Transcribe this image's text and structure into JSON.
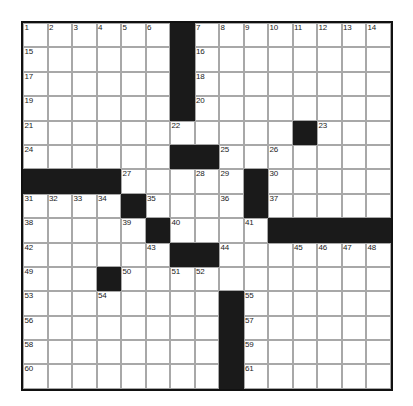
{
  "puzzle": {
    "type": "crossword-grid",
    "title": "Crossword Puzzle Grid",
    "rows": 15,
    "cols": 15,
    "cell_size_px": 24.5,
    "colors": {
      "background": "#ffffff",
      "cell_fill": "#ffffff",
      "block_fill": "#1a1a1a",
      "grid_line": "#a8a8a8",
      "border": "#111111",
      "number_text": "#1b1b1b"
    },
    "legend": {
      "white_cell": "fillable answer square",
      "black_cell": "blocked square"
    },
    "block_count": 36,
    "number_count": 61,
    "max_clue_number": 61,
    "grid": [
      [
        "1",
        "2",
        "3",
        "4",
        "5",
        "6",
        "#",
        "7",
        "8",
        "9",
        "10",
        "11",
        "12",
        "13",
        "14"
      ],
      [
        "15",
        "",
        "",
        "",
        "",
        "",
        "#",
        "16",
        "",
        "",
        "",
        "",
        "",
        "",
        ""
      ],
      [
        "17",
        "",
        "",
        "",
        "",
        "",
        "#",
        "18",
        "",
        "",
        "",
        "",
        "",
        "",
        ""
      ],
      [
        "19",
        "",
        "",
        "",
        "",
        "",
        "#",
        "20",
        "",
        "",
        "",
        "",
        "",
        "",
        ""
      ],
      [
        "21",
        "",
        "",
        "",
        "",
        "",
        "22",
        "",
        "",
        "",
        "",
        "#",
        "23",
        "",
        ""
      ],
      [
        "24",
        "",
        "",
        "",
        "",
        "",
        "#",
        "#",
        "25",
        "",
        "26",
        "",
        "",
        "",
        ""
      ],
      [
        "#",
        "#",
        "#",
        "#",
        "27",
        "",
        "",
        "28",
        "29",
        "#",
        "30",
        "",
        "",
        "",
        ""
      ],
      [
        "31",
        "32",
        "33",
        "34",
        "#",
        "35",
        "",
        "",
        "36",
        "#",
        "37",
        "",
        "",
        "",
        ""
      ],
      [
        "38",
        "",
        "",
        "",
        "39",
        "#",
        "40",
        "",
        "",
        "41",
        "#",
        "#",
        "#",
        "#",
        "#"
      ],
      [
        "42",
        "",
        "",
        "",
        "",
        "43",
        "#",
        "#",
        "44",
        "",
        "",
        "45",
        "46",
        "47",
        "48"
      ],
      [
        "49",
        "",
        "",
        "#",
        "50",
        "",
        "51",
        "52",
        "",
        "",
        "",
        "",
        "",
        "",
        ""
      ],
      [
        "53",
        "",
        "",
        "54",
        "",
        "",
        "",
        "",
        "#",
        "55",
        "",
        "",
        "",
        "",
        ""
      ],
      [
        "56",
        "",
        "",
        "",
        "",
        "",
        "",
        "",
        "#",
        "57",
        "",
        "",
        "",
        "",
        ""
      ],
      [
        "58",
        "",
        "",
        "",
        "",
        "",
        "",
        "",
        "#",
        "59",
        "",
        "",
        "",
        "",
        ""
      ],
      [
        "60",
        "",
        "",
        "",
        "",
        "",
        "",
        "",
        "#",
        "61",
        "",
        "",
        "",
        "",
        ""
      ]
    ]
  }
}
